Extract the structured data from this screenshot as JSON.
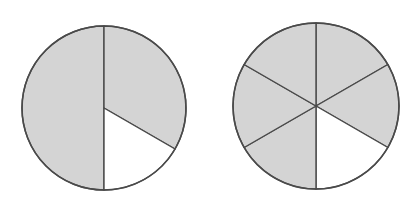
{
  "figure": {
    "background": "#ffffff",
    "shaded_color": "#d4d4d4",
    "unshaded_color": "#ffffff",
    "stroke_color": "#4a4a4a",
    "circles": [
      {
        "name": "left-circle",
        "cx": 104,
        "cy": 108,
        "r": 82,
        "description": "Circle divided into a left half and a right half; the right half is split into a 2/3 shaded sector and a 1/6 unshaded sector",
        "sectors": [
          {
            "start_deg": 180,
            "end_deg": 360,
            "shaded": true
          },
          {
            "start_deg": 0,
            "end_deg": 120,
            "shaded": true
          },
          {
            "start_deg": 120,
            "end_deg": 180,
            "shaded": false
          }
        ]
      },
      {
        "name": "right-circle",
        "cx": 316,
        "cy": 106,
        "r": 83,
        "description": "Circle divided into 6 equal sectors; 5 shaded, 1 unshaded (lower right)",
        "sectors": [
          {
            "start_deg": 0,
            "end_deg": 60,
            "shaded": true
          },
          {
            "start_deg": 60,
            "end_deg": 120,
            "shaded": true
          },
          {
            "start_deg": 120,
            "end_deg": 180,
            "shaded": false
          },
          {
            "start_deg": 180,
            "end_deg": 240,
            "shaded": true
          },
          {
            "start_deg": 240,
            "end_deg": 300,
            "shaded": true
          },
          {
            "start_deg": 300,
            "end_deg": 360,
            "shaded": true
          }
        ]
      }
    ]
  }
}
